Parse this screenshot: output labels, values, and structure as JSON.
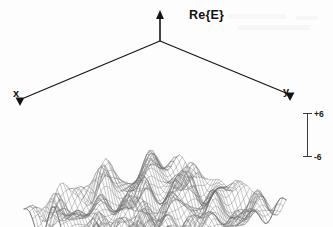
{
  "figure": {
    "kind": "3d-wireframe-surface-plot",
    "background_color": "#fdfdfd",
    "mesh_color": "#6e6e6e",
    "axis_color": "#141414"
  },
  "axes": {
    "vertical": {
      "label": "Re{E}",
      "arrow": "up-arrow-icon"
    },
    "left": {
      "label": "x",
      "arrow": "down-arrow-icon"
    },
    "right": {
      "label": "y",
      "arrow": "down-arrow-icon"
    }
  },
  "scalebar": {
    "name": "amplitude-scale-bar",
    "top_label": "+6",
    "bottom_label": "-6"
  },
  "chart_data": {
    "type": "line",
    "title": "",
    "subtitle": "",
    "xlabel": "x",
    "ylabel": "y",
    "zlabel": "Re{E}",
    "grid": true,
    "legend": null,
    "surface": {
      "description": "Dense rectangular wireframe mesh of the real part of a randomly-modulated field (speckle / multi-mode interference pattern) drawn in axonometric projection; many rounded peaks and valleys of comparable height fill the whole x-y domain.",
      "projection": "axonometric",
      "mesh_rows": 46,
      "mesh_cols": 46,
      "zlim": [
        -6,
        6
      ],
      "z_scale_ticks": [
        6,
        -6
      ],
      "amplitude_peak": 6,
      "amplitude_trough": -6,
      "wave_count_x": 7,
      "wave_count_y": 7,
      "seed": 20250614
    }
  }
}
